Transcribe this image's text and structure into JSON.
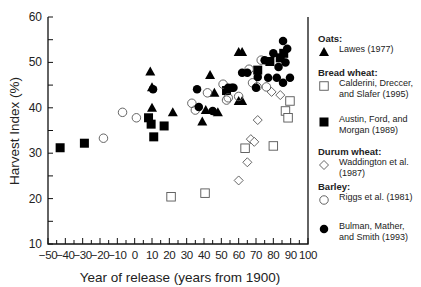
{
  "chart_data": {
    "type": "scatter",
    "title": "",
    "xlabel": "Year of release (years from 1900)",
    "ylabel": "Harvest Index (%)",
    "xlim": [
      -50,
      100
    ],
    "ylim": [
      10,
      60
    ],
    "xticks": [
      -50,
      -40,
      -30,
      -20,
      -10,
      0,
      10,
      20,
      30,
      40,
      50,
      60,
      70,
      80,
      90,
      100
    ],
    "yticks": [
      10,
      20,
      30,
      40,
      50,
      60
    ],
    "grid": false,
    "legend_position": "right",
    "series": [
      {
        "name": "Lawes (1977)",
        "group": "Oats",
        "marker": "filled-triangle",
        "points": [
          [
            9,
            48
          ],
          [
            10,
            40
          ],
          [
            10,
            44.5
          ],
          [
            22,
            39
          ],
          [
            39,
            37
          ],
          [
            43.5,
            47.2
          ],
          [
            46,
            43.3
          ],
          [
            48,
            39
          ],
          [
            60,
            52.3
          ],
          [
            62,
            52.3
          ],
          [
            60,
            41.5
          ],
          [
            62,
            41.5
          ],
          [
            41,
            39.5
          ]
        ]
      },
      {
        "name": "Calderini, Dreccer, and Slafer (1995)",
        "group": "Bread wheat",
        "marker": "open-square",
        "points": [
          [
            21,
            20.4
          ],
          [
            40.6,
            21.2
          ],
          [
            63.7,
            31.1
          ],
          [
            80,
            31.6
          ],
          [
            87,
            39.3
          ],
          [
            88.5,
            37.8
          ],
          [
            89.6,
            41.5
          ]
        ]
      },
      {
        "name": "Austin, Ford, and Morgan (1989)",
        "group": "Bread wheat",
        "marker": "filled-square",
        "points": [
          [
            -43,
            31.2
          ],
          [
            -29,
            32.2
          ],
          [
            8,
            37.8
          ],
          [
            9.5,
            36.4
          ],
          [
            11,
            33.6
          ],
          [
            17,
            36
          ],
          [
            53,
            43.8
          ],
          [
            71,
            48.3
          ],
          [
            78,
            50.2
          ],
          [
            84,
            51
          ],
          [
            86,
            52
          ]
        ]
      },
      {
        "name": "Waddington et al. (1987)",
        "group": "Durum wheat",
        "marker": "open-diamond",
        "points": [
          [
            60,
            24
          ],
          [
            65,
            28
          ],
          [
            67,
            33.1
          ],
          [
            69,
            32.5
          ],
          [
            71,
            37.3
          ],
          [
            79,
            43.5
          ],
          [
            84,
            42.8
          ]
        ]
      },
      {
        "name": "Riggs et al. (1981)",
        "group": "Barley",
        "marker": "open-circle",
        "points": [
          [
            -18,
            33.3
          ],
          [
            -7,
            39
          ],
          [
            1,
            37.8
          ],
          [
            33,
            41
          ],
          [
            35,
            39.5
          ],
          [
            42,
            43.3
          ],
          [
            51,
            45.2
          ],
          [
            53,
            41.7
          ],
          [
            54,
            42.2
          ],
          [
            60,
            42.5
          ],
          [
            66,
            48.5
          ],
          [
            68,
            45.5
          ],
          [
            70.6,
            44.6
          ],
          [
            76,
            44.6
          ],
          [
            73,
            50.5
          ]
        ]
      },
      {
        "name": "Bulman, Mather, and Smith (1993)",
        "group": "Barley",
        "marker": "filled-circle",
        "points": [
          [
            10.6,
            44.1
          ],
          [
            36,
            44.1
          ],
          [
            37,
            40.2
          ],
          [
            45,
            39.3
          ],
          [
            54,
            44.4
          ],
          [
            57,
            44.4
          ],
          [
            56,
            44.4
          ],
          [
            62,
            47.7
          ],
          [
            65,
            47.7
          ],
          [
            70,
            44.4
          ],
          [
            71,
            46.8
          ],
          [
            77,
            46.6
          ],
          [
            82,
            46.6
          ],
          [
            85.6,
            45.5
          ],
          [
            89.6,
            46.6
          ],
          [
            75,
            50.5
          ],
          [
            80,
            52
          ],
          [
            85.6,
            54.7
          ],
          [
            88,
            53
          ],
          [
            83,
            49
          ],
          [
            87,
            50
          ]
        ]
      }
    ]
  },
  "legend": {
    "groups": [
      {
        "title": "Oats:",
        "entries": [
          {
            "label": "Lawes (1977)",
            "marker": "filled-triangle"
          }
        ]
      },
      {
        "title": "Bread wheat:",
        "entries": [
          {
            "label": "Calderini, Dreccer, and Slafer (1995)",
            "marker": "open-square"
          },
          {
            "label": "Austin, Ford, and Morgan (1989)",
            "marker": "filled-square"
          }
        ]
      },
      {
        "title": "Durum wheat:",
        "entries": [
          {
            "label": "Waddington et al. (1987)",
            "marker": "open-diamond"
          }
        ]
      },
      {
        "title": "Barley:",
        "entries": [
          {
            "label": "Riggs et al. (1981)",
            "marker": "open-circle"
          }
        ]
      },
      {
        "title": "",
        "entries": [
          {
            "label": "Bulman, Mather, and Smith (1993)",
            "marker": "filled-circle"
          }
        ]
      }
    ]
  }
}
